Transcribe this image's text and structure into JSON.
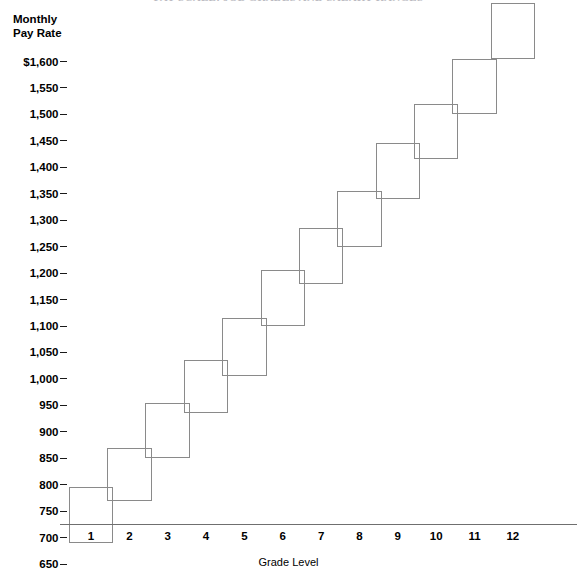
{
  "chart": {
    "title": "PAY SCALE: JOB GRADES AND SALARY RANGES",
    "y_axis_title_line1": "Monthly",
    "y_axis_title_line2": "Pay Rate",
    "x_axis_title": "Grade Level",
    "currency_symbol": "$",
    "axis_color": "#6f6f6f",
    "box_color": "#8a8a8a",
    "text_color": "#000000",
    "background_color": "#ffffff"
  },
  "chart_data": {
    "type": "bar",
    "title": "PAY SCALE: JOB GRADES AND SALARY RANGES",
    "xlabel": "Grade Level",
    "ylabel": "Monthly Pay Rate",
    "grid": false,
    "legend": "none",
    "ylim": [
      650,
      1710
    ],
    "xlim": [
      0.5,
      12.5
    ],
    "ytick_step": 50,
    "categories": [
      "1",
      "2",
      "3",
      "4",
      "5",
      "6",
      "7",
      "8",
      "9",
      "10",
      "11",
      "12"
    ],
    "ytick_labels": [
      "$1,600",
      "1,550",
      "1,500",
      "1,450",
      "1,400",
      "1,350",
      "1,300",
      "1,250",
      "1,200",
      "1,150",
      "1,100",
      "1,050",
      "1,000",
      "950",
      "900",
      "850",
      "800",
      "750",
      "700",
      "650"
    ],
    "ytick_values": [
      1600,
      1550,
      1500,
      1450,
      1400,
      1350,
      1300,
      1250,
      1200,
      1150,
      1100,
      1050,
      1000,
      950,
      900,
      850,
      800,
      750,
      700,
      650
    ],
    "series": [
      {
        "name": "Pay range minimum",
        "values": [
          690,
          770,
          850,
          935,
          1005,
          1100,
          1180,
          1250,
          1340,
          1415,
          1500,
          1605
        ]
      },
      {
        "name": "Pay range maximum",
        "values": [
          795,
          870,
          955,
          1035,
          1115,
          1205,
          1285,
          1355,
          1445,
          1520,
          1605,
          1710
        ]
      }
    ],
    "ranges": [
      {
        "grade": "1",
        "min": 690,
        "max": 795
      },
      {
        "grade": "2",
        "min": 770,
        "max": 870
      },
      {
        "grade": "3",
        "min": 850,
        "max": 955
      },
      {
        "grade": "4",
        "min": 935,
        "max": 1035
      },
      {
        "grade": "5",
        "min": 1005,
        "max": 1115
      },
      {
        "grade": "6",
        "min": 1100,
        "max": 1205
      },
      {
        "grade": "7",
        "min": 1180,
        "max": 1285
      },
      {
        "grade": "8",
        "min": 1250,
        "max": 1355
      },
      {
        "grade": "9",
        "min": 1340,
        "max": 1445
      },
      {
        "grade": "10",
        "min": 1415,
        "max": 1520
      },
      {
        "grade": "11",
        "min": 1500,
        "max": 1605
      },
      {
        "grade": "12",
        "min": 1605,
        "max": 1710
      }
    ]
  }
}
